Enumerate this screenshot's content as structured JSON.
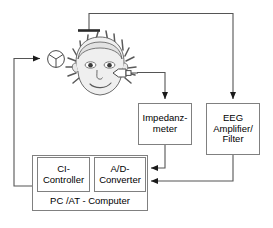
{
  "diagram": {
    "background_color": "#ffffff",
    "line_color": "#555555",
    "box_border_color": "#808080",
    "box_fill_color": "#ffffff",
    "text_color": "#000000",
    "nodes": {
      "impedance_meter": {
        "label": "Impedanz-\nmeter",
        "line1": "Impedanz-",
        "line2": "meter"
      },
      "eeg_amplifier": {
        "label": "EEG\nAmplifier/\nFilter",
        "line1": "EEG",
        "line2": "Amplifier/",
        "line3": "Filter"
      },
      "ci_controller": {
        "label": "CI-\nController",
        "line1": "CI-",
        "line2": "Controller"
      },
      "ad_converter": {
        "label": "A/D-\nConverter",
        "line1": "A/D-",
        "line2": "Converter"
      },
      "pc_computer": {
        "label": "PC /AT - Computer"
      }
    },
    "graphics": {
      "head": "cartoon-head-with-spiky-hair",
      "coil": "transmitter-coil-symbol",
      "plug": "electrode-plug-connector",
      "scalp_electrode": "scalp-electrode-bar"
    },
    "connections": [
      {
        "from": "ci-controller",
        "to": "transmitter-coil",
        "arrow": "to-coil"
      },
      {
        "from": "scalp-electrode",
        "to": "eeg-amplifier",
        "arrow": "down-into-eeg"
      },
      {
        "from": "head-plug",
        "to": "impedance-meter",
        "arrow": "down-into-impedance"
      },
      {
        "from": "impedance-meter",
        "to": "ad-converter",
        "arrow": "left-into-ad"
      },
      {
        "from": "eeg-amplifier",
        "to": "ad-converter",
        "arrow": "left-into-ad"
      }
    ]
  }
}
